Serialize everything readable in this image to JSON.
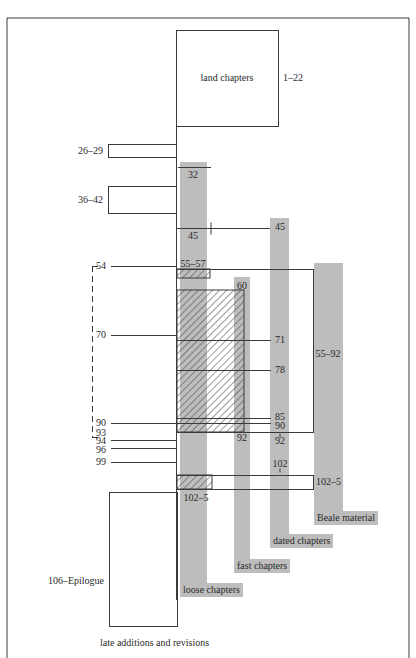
{
  "figure": {
    "frame": {
      "left": 7,
      "top": 18,
      "right": 409,
      "bottom": 658
    },
    "colors": {
      "line": "#3a3a3a",
      "bar": "#bdbdbd",
      "hatch": "#3a3a3a",
      "background": "#ffffff"
    },
    "boxes": [
      {
        "id": "land-chapters",
        "x": 176,
        "y": 30,
        "w": 102,
        "h": 96,
        "label": "land chapters",
        "label_x": 227,
        "label_y": 78,
        "side_label": "1–22",
        "side_x": 283,
        "side_y": 78
      },
      {
        "id": "chapters-26-29",
        "x": 108,
        "y": 144,
        "w": 68,
        "h": 13,
        "side_label": "26–29",
        "side_x": 103,
        "side_y": 151,
        "side_align": "right"
      },
      {
        "id": "chapters-36-42",
        "x": 108,
        "y": 186,
        "w": 68,
        "h": 27,
        "side_label": "36–42",
        "side_x": 103,
        "side_y": 200,
        "side_align": "right"
      },
      {
        "id": "late-additions",
        "x": 109,
        "y": 492,
        "w": 68,
        "h": 134,
        "side_label": "106–Epilogue",
        "side_x": 104,
        "side_y": 581,
        "side_align": "right"
      }
    ],
    "bars": [
      {
        "id": "loose-chapters",
        "x": 180,
        "y": 162,
        "w": 27,
        "h": 432,
        "tag": "loose chapters",
        "tag_x": 180,
        "tag_y": 583,
        "tag_w": 68
      },
      {
        "id": "fast-chapters",
        "x": 234,
        "y": 277,
        "w": 16,
        "h": 283,
        "tag": "fast chapters",
        "tag_x": 234,
        "tag_y": 559,
        "tag_w": 60
      },
      {
        "id": "dated-chapters",
        "x": 270,
        "y": 218,
        "w": 19,
        "h": 318,
        "tag": "dated chapters",
        "tag_x": 270,
        "tag_y": 534,
        "tag_w": 70
      },
      {
        "id": "beale-material",
        "x": 314,
        "y": 263,
        "w": 29,
        "h": 257,
        "tag": "Beale material",
        "tag_x": 314,
        "tag_y": 511,
        "tag_w": 70
      }
    ],
    "hatched": [
      {
        "id": "hatch-55-57",
        "x": 177,
        "y": 269,
        "w": 33,
        "h": 9
      },
      {
        "id": "hatch-60-92",
        "x": 177,
        "y": 290,
        "w": 67,
        "h": 142
      },
      {
        "id": "hatch-102-5",
        "x": 177,
        "y": 475,
        "w": 35,
        "h": 14
      }
    ],
    "frames": [
      {
        "id": "beale-frame-55-92",
        "x": 176,
        "y": 269,
        "w": 137,
        "h": 163
      },
      {
        "id": "frame-102-5",
        "x": 176,
        "y": 475,
        "w": 137,
        "h": 14
      }
    ],
    "spine": {
      "x": 176,
      "y1": 126,
      "y2": 600
    },
    "lines": [
      {
        "x1": 178,
        "y1": 167,
        "x2": 211,
        "y2": 167
      },
      {
        "x1": 176,
        "y1": 228,
        "x2": 270,
        "y2": 228
      },
      {
        "x1": 211,
        "y1": 222,
        "x2": 211,
        "y2": 234
      },
      {
        "x1": 111,
        "y1": 266,
        "x2": 176,
        "y2": 266
      },
      {
        "x1": 111,
        "y1": 335,
        "x2": 176,
        "y2": 335
      },
      {
        "x1": 176,
        "y1": 340,
        "x2": 271,
        "y2": 340
      },
      {
        "x1": 176,
        "y1": 370,
        "x2": 271,
        "y2": 370
      },
      {
        "x1": 176,
        "y1": 418,
        "x2": 271,
        "y2": 418
      },
      {
        "x1": 111,
        "y1": 423,
        "x2": 271,
        "y2": 423
      },
      {
        "x1": 111,
        "y1": 440,
        "x2": 176,
        "y2": 440
      },
      {
        "x1": 111,
        "y1": 448,
        "x2": 176,
        "y2": 448
      },
      {
        "x1": 111,
        "y1": 462,
        "x2": 176,
        "y2": 462
      },
      {
        "x1": 109,
        "y1": 492,
        "x2": 176,
        "y2": 492
      },
      {
        "x1": 280,
        "y1": 433,
        "x2": 280,
        "y2": 437
      },
      {
        "x1": 280,
        "y1": 468,
        "x2": 280,
        "y2": 472
      }
    ],
    "bracket": {
      "x": 92,
      "y1": 266,
      "y2": 437,
      "tick": 6
    },
    "labels": [
      {
        "text": "32",
        "x": 193,
        "y": 175,
        "align": "center"
      },
      {
        "text": "45",
        "x": 193,
        "y": 236,
        "align": "center"
      },
      {
        "text": "45",
        "x": 280,
        "y": 227,
        "align": "center"
      },
      {
        "text": "55–57",
        "x": 193,
        "y": 264,
        "align": "center"
      },
      {
        "text": "60",
        "x": 242,
        "y": 286,
        "align": "center"
      },
      {
        "text": "54",
        "x": 106,
        "y": 266,
        "align": "right"
      },
      {
        "text": "70",
        "x": 106,
        "y": 335,
        "align": "right"
      },
      {
        "text": "71",
        "x": 275,
        "y": 340,
        "align": "left"
      },
      {
        "text": "78",
        "x": 275,
        "y": 370,
        "align": "left"
      },
      {
        "text": "55–92",
        "x": 328,
        "y": 354,
        "align": "center"
      },
      {
        "text": "85",
        "x": 275,
        "y": 417,
        "align": "left"
      },
      {
        "text": "90",
        "x": 275,
        "y": 426,
        "align": "left"
      },
      {
        "text": "90",
        "x": 106,
        "y": 423,
        "align": "right"
      },
      {
        "text": "93",
        "x": 106,
        "y": 433,
        "align": "right"
      },
      {
        "text": "94",
        "x": 106,
        "y": 441,
        "align": "right"
      },
      {
        "text": "96",
        "x": 106,
        "y": 450,
        "align": "right"
      },
      {
        "text": "99",
        "x": 106,
        "y": 462,
        "align": "right"
      },
      {
        "text": "92",
        "x": 242,
        "y": 438,
        "align": "center"
      },
      {
        "text": "92",
        "x": 280,
        "y": 441,
        "align": "center"
      },
      {
        "text": "102",
        "x": 280,
        "y": 464,
        "align": "center"
      },
      {
        "text": "102–5",
        "x": 316,
        "y": 482,
        "align": "left"
      },
      {
        "text": "102–5",
        "x": 196,
        "y": 498,
        "align": "center"
      }
    ],
    "footer_label": {
      "text": "late additions and revisions",
      "x": 100,
      "y": 643
    }
  }
}
